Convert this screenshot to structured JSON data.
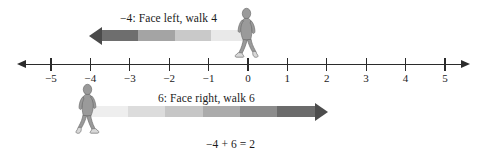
{
  "figure": {
    "type": "number-line-diagram",
    "background_color": "#ffffff",
    "line_color": "#2b2b2b"
  },
  "number_line": {
    "min": -5,
    "max": 5,
    "tick_values": [
      -5,
      -4,
      -3,
      -2,
      -1,
      0,
      1,
      2,
      3,
      4,
      5
    ],
    "tick_labels": [
      "−5",
      "−4",
      "−3",
      "−2",
      "−1",
      "0",
      "1",
      "2",
      "3",
      "4",
      "5"
    ],
    "left_arrowhead": true,
    "right_arrowhead": true
  },
  "moves": [
    {
      "id": "move-left",
      "caption": "−4: Face left, walk 4",
      "start": 0,
      "end": -4,
      "distance": 4,
      "direction": "left",
      "segment_shades": [
        "#e9e9e9",
        "#c9c9c9",
        "#a4a4a4",
        "#6e6e6e"
      ],
      "arrowhead_color": "#4a4a4a"
    },
    {
      "id": "move-right",
      "caption": "6: Face right, walk 6",
      "start": -4,
      "end": 2,
      "distance": 6,
      "direction": "right",
      "segment_shades": [
        "#eeeeee",
        "#dcdcdc",
        "#c6c6c6",
        "#ababab",
        "#8c8c8c",
        "#6b6b6b"
      ],
      "arrowhead_color": "#4c4c4c"
    }
  ],
  "equation": "−4 + 6 = 2",
  "walkers": [
    {
      "id": "walker-top",
      "position": 0,
      "facing": "right"
    },
    {
      "id": "walker-bottom",
      "position": -4,
      "facing": "left"
    }
  ]
}
